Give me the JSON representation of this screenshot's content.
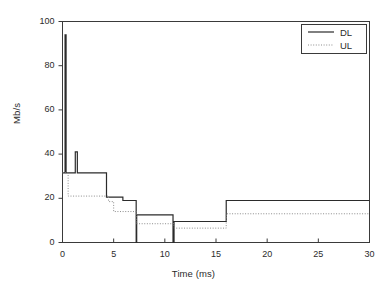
{
  "chart_data": {
    "type": "line",
    "title": "",
    "xlabel": "Time (ms)",
    "ylabel": "Mb/s",
    "xlim": [
      0,
      30
    ],
    "ylim": [
      0,
      100
    ],
    "xticks": [
      0,
      5,
      10,
      15,
      20,
      25,
      30
    ],
    "yticks": [
      0,
      20,
      40,
      60,
      80,
      100
    ],
    "xtick_labels": [
      "0",
      "5",
      "10",
      "15",
      "20",
      "25",
      "30"
    ],
    "ytick_labels": [
      "0",
      "20",
      "40",
      "60",
      "80",
      "100"
    ],
    "grid": false,
    "legend_position": "top-right",
    "series": [
      {
        "name": "DL",
        "style": "solid",
        "color": "#2b2b2b",
        "points": [
          [
            0.0,
            31.5
          ],
          [
            0.25,
            31.5
          ],
          [
            0.25,
            94.0
          ],
          [
            0.35,
            94.0
          ],
          [
            0.35,
            31.5
          ],
          [
            1.25,
            31.5
          ],
          [
            1.25,
            41.0
          ],
          [
            1.45,
            41.0
          ],
          [
            1.45,
            31.5
          ],
          [
            4.3,
            31.5
          ],
          [
            4.3,
            20.5
          ],
          [
            5.9,
            20.5
          ],
          [
            5.9,
            19.0
          ],
          [
            7.2,
            19.0
          ],
          [
            7.2,
            0.0
          ],
          [
            7.25,
            0.0
          ],
          [
            7.25,
            12.5
          ],
          [
            10.8,
            12.5
          ],
          [
            10.8,
            0.0
          ],
          [
            10.9,
            0.0
          ],
          [
            10.9,
            9.5
          ],
          [
            16.0,
            9.5
          ],
          [
            16.0,
            19.0
          ],
          [
            30.0,
            19.0
          ]
        ]
      },
      {
        "name": "UL",
        "style": "dotted",
        "color": "#8c8c8c",
        "points": [
          [
            0.0,
            31.5
          ],
          [
            0.55,
            31.5
          ],
          [
            0.55,
            21.0
          ],
          [
            4.5,
            21.0
          ],
          [
            4.5,
            18.5
          ],
          [
            5.0,
            18.5
          ],
          [
            5.0,
            14.0
          ],
          [
            7.2,
            14.0
          ],
          [
            7.2,
            8.5
          ],
          [
            10.9,
            8.5
          ],
          [
            10.9,
            6.5
          ],
          [
            16.0,
            6.5
          ],
          [
            16.0,
            13.0
          ],
          [
            30.0,
            13.0
          ]
        ]
      }
    ],
    "annotations": []
  },
  "legend": {
    "items": [
      {
        "label": "DL",
        "style": "solid"
      },
      {
        "label": "UL",
        "style": "dotted"
      }
    ]
  }
}
